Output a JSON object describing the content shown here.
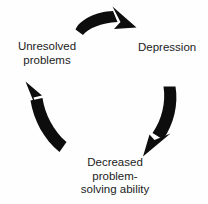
{
  "diagram": {
    "type": "cyclical-flow-diagram",
    "background_color": "#fefefe",
    "arrow_color": "#0d0d0d",
    "text_color": "#1c1c1c",
    "direction": "clockwise",
    "nodes": [
      {
        "id": "depression",
        "label": "Depression",
        "position": "right"
      },
      {
        "id": "decreased-problem-solving",
        "label": "Decreased\nproblem-\nsolving ability",
        "position": "bottom"
      },
      {
        "id": "unresolved-problems",
        "label": "Unresolved\nproblems",
        "position": "left"
      }
    ],
    "arrows": [
      {
        "id": "top-arrow",
        "from": "unresolved-problems",
        "to": "depression",
        "name": "curved-arrow-top"
      },
      {
        "id": "right-arrow",
        "from": "depression",
        "to": "decreased-problem-solving",
        "name": "curved-arrow-right"
      },
      {
        "id": "left-arrow",
        "from": "decreased-problem-solving",
        "to": "unresolved-problems",
        "name": "curved-arrow-left"
      }
    ]
  }
}
